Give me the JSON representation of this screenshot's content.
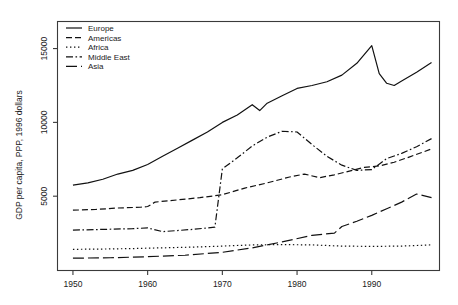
{
  "chart_data": {
    "type": "line",
    "title": "",
    "xlabel": "",
    "ylabel": "GDP per capita, PPP, 1996 dollars",
    "xlim": [
      1948,
      1999
    ],
    "ylim": [
      0,
      16800
    ],
    "xticks": [
      1950,
      1960,
      1970,
      1980,
      1990
    ],
    "yticks": [
      5000,
      10000,
      15000
    ],
    "xtick_labels": [
      "1950",
      "1960",
      "1970",
      "1980",
      "1990"
    ],
    "ytick_labels": [
      "5000",
      "10000",
      "15000"
    ],
    "grid": false,
    "legend_position": "top-left",
    "series": [
      {
        "name": "Europe",
        "style": "solid",
        "x": [
          1950,
          1952,
          1954,
          1956,
          1958,
          1960,
          1962,
          1964,
          1966,
          1968,
          1970,
          1972,
          1974,
          1975,
          1976,
          1978,
          1980,
          1982,
          1984,
          1986,
          1988,
          1990,
          1991,
          1992,
          1993,
          1994,
          1996,
          1998
        ],
        "y": [
          5750,
          5900,
          6150,
          6500,
          6750,
          7150,
          7700,
          8250,
          8800,
          9350,
          10000,
          10500,
          11200,
          10800,
          11300,
          11800,
          12300,
          12500,
          12750,
          13200,
          14000,
          15200,
          13300,
          12650,
          12500,
          12800,
          13400,
          14050
        ]
      },
      {
        "name": "Americas",
        "style": "dashed",
        "x": [
          1950,
          1953,
          1956,
          1959,
          1960,
          1961,
          1964,
          1967,
          1970,
          1973,
          1976,
          1979,
          1981,
          1983,
          1985,
          1987,
          1989,
          1991,
          1993,
          1995,
          1998
        ],
        "y": [
          4050,
          4100,
          4200,
          4250,
          4300,
          4600,
          4750,
          4900,
          5100,
          5550,
          5900,
          6300,
          6500,
          6250,
          6450,
          6700,
          6950,
          7050,
          7300,
          7650,
          8200
        ]
      },
      {
        "name": "Africa",
        "style": "dotted",
        "x": [
          1950,
          1954,
          1958,
          1960,
          1962,
          1966,
          1970,
          1974,
          1978,
          1982,
          1986,
          1990,
          1994,
          1998
        ],
        "y": [
          1400,
          1420,
          1450,
          1480,
          1500,
          1550,
          1620,
          1700,
          1720,
          1700,
          1620,
          1600,
          1620,
          1700
        ]
      },
      {
        "name": "Middle East",
        "style": "dashdot",
        "x": [
          1950,
          1954,
          1958,
          1960,
          1962,
          1966,
          1969,
          1970,
          1972,
          1974,
          1976,
          1978,
          1980,
          1982,
          1984,
          1986,
          1988,
          1990,
          1992,
          1994,
          1996,
          1998
        ],
        "y": [
          2700,
          2750,
          2800,
          2850,
          2600,
          2750,
          2900,
          6850,
          7600,
          8400,
          9000,
          9400,
          9350,
          8500,
          7700,
          7100,
          6750,
          6800,
          7550,
          7900,
          8350,
          8900
        ]
      },
      {
        "name": "Asia",
        "style": "longdash",
        "x": [
          1950,
          1955,
          1960,
          1965,
          1970,
          1974,
          1978,
          1982,
          1985,
          1986,
          1988,
          1990,
          1992,
          1994,
          1996,
          1998
        ],
        "y": [
          800,
          830,
          900,
          1000,
          1200,
          1500,
          1900,
          2350,
          2500,
          2950,
          3300,
          3700,
          4150,
          4600,
          5150,
          4900
        ]
      }
    ]
  },
  "legend": {
    "items": [
      {
        "label": "Europe",
        "style": "solid"
      },
      {
        "label": "Americas",
        "style": "dashed"
      },
      {
        "label": "Africa",
        "style": "dotted"
      },
      {
        "label": "Middle East",
        "style": "dashdot"
      },
      {
        "label": "Asia",
        "style": "longdash"
      }
    ]
  },
  "colors": {
    "line": "#111111",
    "axis": "#3a3a3a",
    "text": "#1a1a1a",
    "background": "#ffffff"
  }
}
